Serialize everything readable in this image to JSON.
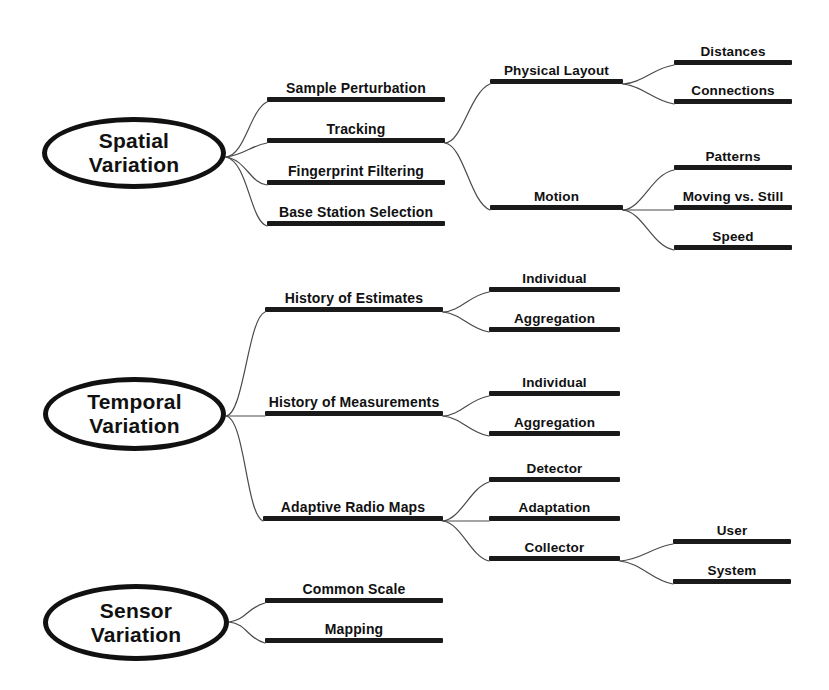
{
  "diagram": {
    "type": "mind-map",
    "background_color": "#ffffff",
    "ink_color": "#111111",
    "bar_color": "#1a1a1a"
  },
  "roots": [
    {
      "id": "spatial",
      "label": "Spatial\nVariation",
      "x": 42,
      "y": 117,
      "w": 184,
      "h": 72
    },
    {
      "id": "temporal",
      "label": "Temporal\nVariation",
      "x": 43,
      "y": 377,
      "w": 183,
      "h": 74
    },
    {
      "id": "sensor",
      "label": "Sensor\nVariation",
      "x": 43,
      "y": 584,
      "w": 186,
      "h": 77
    }
  ],
  "branches": [
    {
      "id": "sample-perturbation",
      "label": "Sample Perturbation",
      "level": 1,
      "parent": "spatial",
      "x": 267,
      "y": 102,
      "w": 178
    },
    {
      "id": "tracking",
      "label": "Tracking",
      "level": 1,
      "parent": "spatial",
      "x": 267,
      "y": 143,
      "w": 178
    },
    {
      "id": "fingerprint-filtering",
      "label": "Fingerprint Filtering",
      "level": 1,
      "parent": "spatial",
      "x": 267,
      "y": 185,
      "w": 178
    },
    {
      "id": "base-station-selection",
      "label": "Base Station Selection",
      "level": 1,
      "parent": "spatial",
      "x": 267,
      "y": 226,
      "w": 178
    },
    {
      "id": "physical-layout",
      "label": "Physical Layout",
      "level": 2,
      "parent": "tracking",
      "x": 490,
      "y": 84,
      "w": 133
    },
    {
      "id": "distances",
      "label": "Distances",
      "level": 3,
      "parent": "physical-layout",
      "x": 674,
      "y": 65,
      "w": 118
    },
    {
      "id": "connections",
      "label": "Connections",
      "level": 3,
      "parent": "physical-layout",
      "x": 674,
      "y": 104,
      "w": 118
    },
    {
      "id": "motion",
      "label": "Motion",
      "level": 2,
      "parent": "tracking",
      "x": 490,
      "y": 210,
      "w": 133
    },
    {
      "id": "patterns",
      "label": "Patterns",
      "level": 3,
      "parent": "motion",
      "x": 674,
      "y": 170,
      "w": 118
    },
    {
      "id": "moving-vs-still",
      "label": "Moving vs. Still",
      "level": 3,
      "parent": "motion",
      "x": 674,
      "y": 210,
      "w": 118
    },
    {
      "id": "speed",
      "label": "Speed",
      "level": 3,
      "parent": "motion",
      "x": 674,
      "y": 250,
      "w": 118
    },
    {
      "id": "history-of-estimates",
      "label": "History of Estimates",
      "level": 1,
      "parent": "temporal",
      "x": 265,
      "y": 312,
      "w": 178
    },
    {
      "id": "estimates-individual",
      "label": "Individual",
      "level": 2,
      "parent": "history-of-estimates",
      "x": 489,
      "y": 292,
      "w": 131
    },
    {
      "id": "estimates-aggregation",
      "label": "Aggregation",
      "level": 2,
      "parent": "history-of-estimates",
      "x": 489,
      "y": 332,
      "w": 131
    },
    {
      "id": "history-of-measurements",
      "label": "History of Measurements",
      "level": 1,
      "parent": "temporal",
      "x": 265,
      "y": 416,
      "w": 178
    },
    {
      "id": "measurements-individual",
      "label": "Individual",
      "level": 2,
      "parent": "history-of-measurements",
      "x": 489,
      "y": 396,
      "w": 131
    },
    {
      "id": "measurements-aggregation",
      "label": "Aggregation",
      "level": 2,
      "parent": "history-of-measurements",
      "x": 489,
      "y": 436,
      "w": 131
    },
    {
      "id": "adaptive-radio-maps",
      "label": "Adaptive Radio Maps",
      "level": 1,
      "parent": "temporal",
      "x": 263,
      "y": 521,
      "w": 180
    },
    {
      "id": "detector",
      "label": "Detector",
      "level": 2,
      "parent": "adaptive-radio-maps",
      "x": 489,
      "y": 482,
      "w": 131
    },
    {
      "id": "adaptation",
      "label": "Adaptation",
      "level": 2,
      "parent": "adaptive-radio-maps",
      "x": 489,
      "y": 521,
      "w": 131
    },
    {
      "id": "collector",
      "label": "Collector",
      "level": 2,
      "parent": "adaptive-radio-maps",
      "x": 489,
      "y": 561,
      "w": 131
    },
    {
      "id": "user",
      "label": "User",
      "level": 3,
      "parent": "collector",
      "x": 673,
      "y": 544,
      "w": 118
    },
    {
      "id": "system",
      "label": "System",
      "level": 3,
      "parent": "collector",
      "x": 673,
      "y": 584,
      "w": 118
    },
    {
      "id": "common-scale",
      "label": "Common Scale",
      "level": 1,
      "parent": "sensor",
      "x": 265,
      "y": 603,
      "w": 178
    },
    {
      "id": "mapping",
      "label": "Mapping",
      "level": 1,
      "parent": "sensor",
      "x": 265,
      "y": 643,
      "w": 178
    }
  ],
  "connectors": [
    {
      "id": "c-spatial-sample",
      "d": "M 226,157 C 245,155 250,110 267,102"
    },
    {
      "id": "c-spatial-tracking",
      "d": "M 226,157 C 246,154 250,146 267,143"
    },
    {
      "id": "c-spatial-finger",
      "d": "M 226,157 C 246,160 250,183 267,185"
    },
    {
      "id": "c-spatial-base",
      "d": "M 226,157 C 248,162 250,221 267,226"
    },
    {
      "id": "c-tracking-physical",
      "d": "M 445,143 C 462,143 470,92 490,84"
    },
    {
      "id": "c-tracking-motion",
      "d": "M 445,143 C 464,146 470,202 490,210"
    },
    {
      "id": "c-physical-distances",
      "d": "M 623,84 C 642,83 654,68 674,65"
    },
    {
      "id": "c-physical-connect",
      "d": "M 623,84 C 643,86 654,101 674,104"
    },
    {
      "id": "c-motion-patterns",
      "d": "M 623,210 C 642,209 652,174 674,170"
    },
    {
      "id": "c-motion-moving",
      "d": "M 623,210 C 643,210 654,210 674,210"
    },
    {
      "id": "c-motion-speed",
      "d": "M 623,210 C 643,212 652,246 674,250"
    },
    {
      "id": "c-temporal-est",
      "d": "M 226,416 C 244,414 248,318 265,312"
    },
    {
      "id": "c-temporal-meas",
      "d": "M 226,416 C 245,416 248,416 265,416"
    },
    {
      "id": "c-temporal-maps",
      "d": "M 226,416 C 245,419 246,514 263,521"
    },
    {
      "id": "c-est-individual",
      "d": "M 443,312 C 461,311 470,295 489,292"
    },
    {
      "id": "c-est-aggregation",
      "d": "M 443,312 C 462,314 470,329 489,332"
    },
    {
      "id": "c-meas-individual",
      "d": "M 443,416 C 461,415 470,399 489,396"
    },
    {
      "id": "c-meas-aggregation",
      "d": "M 443,416 C 462,418 470,433 489,436"
    },
    {
      "id": "c-maps-detector",
      "d": "M 443,521 C 461,519 470,488 489,482"
    },
    {
      "id": "c-maps-adaptation",
      "d": "M 443,521 C 462,521 470,521 489,521"
    },
    {
      "id": "c-maps-collector",
      "d": "M 443,521 C 462,524 470,556 489,561"
    },
    {
      "id": "c-collector-user",
      "d": "M 620,561 C 640,560 653,547 673,544"
    },
    {
      "id": "c-collector-system",
      "d": "M 620,561 C 641,563 653,581 673,584"
    },
    {
      "id": "c-sensor-common",
      "d": "M 229,622 C 246,620 248,607 265,603"
    },
    {
      "id": "c-sensor-mapping",
      "d": "M 229,622 C 247,624 248,639 265,643"
    }
  ]
}
